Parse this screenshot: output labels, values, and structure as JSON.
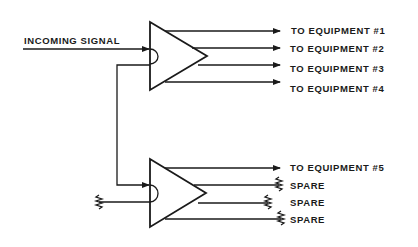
{
  "diagram": {
    "type": "signal distribution amplifier schematic",
    "input_label": "INCOMING SIGNAL",
    "colors": {
      "line": "#1a1a1a",
      "background": "#ffffff"
    },
    "amplifiers": [
      {
        "id": "amp-1",
        "outputs": [
          {
            "label": "TO EQUIPMENT #1",
            "terminator": "arrow"
          },
          {
            "label": "TO EQUIPMENT #2",
            "terminator": "arrow"
          },
          {
            "label": "TO EQUIPMENT #3",
            "terminator": "arrow"
          },
          {
            "label": "TO EQUIPMENT #4",
            "terminator": "arrow"
          }
        ]
      },
      {
        "id": "amp-2",
        "outputs": [
          {
            "label": "TO EQUIPMENT #5",
            "terminator": "arrow"
          },
          {
            "label": "SPARE",
            "terminator": "resistor"
          },
          {
            "label": "SPARE",
            "terminator": "resistor"
          },
          {
            "label": "SPARE",
            "terminator": "resistor"
          }
        ]
      }
    ]
  }
}
